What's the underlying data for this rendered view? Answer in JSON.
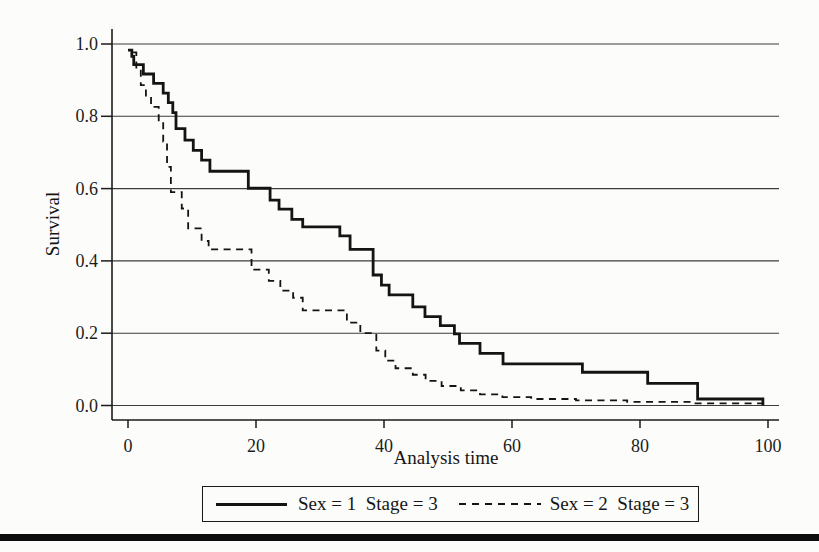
{
  "chart_data": {
    "type": "line",
    "subtype": "kaplan-meier-step",
    "title": "",
    "xlabel": "Analysis time",
    "ylabel": "Survival",
    "xlim": [
      0,
      100
    ],
    "ylim": [
      0.0,
      1.0
    ],
    "x_ticks": [
      0,
      20,
      40,
      60,
      80,
      100
    ],
    "x_tick_labels": [
      "0",
      "20",
      "40",
      "60",
      "80",
      "100"
    ],
    "y_ticks": [
      0.0,
      0.2,
      0.4,
      0.6,
      0.8,
      1.0
    ],
    "y_tick_labels": [
      "0.0",
      "0.2",
      "0.4",
      "0.6",
      "0.8",
      "1.0"
    ],
    "grid": "horizontal-only",
    "legend_position": "bottom-outside-boxed",
    "line_color": "#141414",
    "series": [
      {
        "name": "Sex = 1  Stage = 3",
        "style": "solid",
        "color": "#141414",
        "points": [
          [
            0.0,
            0.983
          ],
          [
            0.6,
            0.966
          ],
          [
            0.9,
            0.943
          ],
          [
            2.4,
            0.917
          ],
          [
            4.0,
            0.891
          ],
          [
            5.5,
            0.864
          ],
          [
            6.3,
            0.838
          ],
          [
            7.0,
            0.81
          ],
          [
            7.5,
            0.766
          ],
          [
            8.9,
            0.734
          ],
          [
            10.2,
            0.706
          ],
          [
            11.5,
            0.679
          ],
          [
            12.8,
            0.648
          ],
          [
            18.8,
            0.601
          ],
          [
            22.2,
            0.568
          ],
          [
            23.6,
            0.543
          ],
          [
            25.6,
            0.515
          ],
          [
            27.3,
            0.494
          ],
          [
            33.1,
            0.469
          ],
          [
            34.7,
            0.432
          ],
          [
            38.3,
            0.361
          ],
          [
            39.6,
            0.333
          ],
          [
            40.8,
            0.306
          ],
          [
            44.5,
            0.273
          ],
          [
            46.4,
            0.246
          ],
          [
            48.8,
            0.221
          ],
          [
            51.0,
            0.198
          ],
          [
            51.8,
            0.172
          ],
          [
            55.0,
            0.144
          ],
          [
            58.6,
            0.115
          ],
          [
            71.0,
            0.092
          ],
          [
            81.2,
            0.061
          ],
          [
            89.0,
            0.018
          ],
          [
            99.2,
            0.0
          ]
        ]
      },
      {
        "name": "Sex = 2  Stage = 3",
        "style": "dashed",
        "color": "#141414",
        "points": [
          [
            0.8,
            0.977
          ],
          [
            1.3,
            0.93
          ],
          [
            2.0,
            0.886
          ],
          [
            2.8,
            0.854
          ],
          [
            3.6,
            0.826
          ],
          [
            4.8,
            0.784
          ],
          [
            5.5,
            0.73
          ],
          [
            6.1,
            0.66
          ],
          [
            6.7,
            0.59
          ],
          [
            8.4,
            0.545
          ],
          [
            9.4,
            0.49
          ],
          [
            11.5,
            0.455
          ],
          [
            12.6,
            0.432
          ],
          [
            19.3,
            0.376
          ],
          [
            22.0,
            0.345
          ],
          [
            23.8,
            0.318
          ],
          [
            25.8,
            0.298
          ],
          [
            27.3,
            0.263
          ],
          [
            34.2,
            0.229
          ],
          [
            36.3,
            0.2
          ],
          [
            38.8,
            0.152
          ],
          [
            40.2,
            0.124
          ],
          [
            41.8,
            0.103
          ],
          [
            44.5,
            0.085
          ],
          [
            46.5,
            0.068
          ],
          [
            49.0,
            0.054
          ],
          [
            52.0,
            0.042
          ],
          [
            55.0,
            0.031
          ],
          [
            58.5,
            0.023
          ],
          [
            63.0,
            0.018
          ],
          [
            70.0,
            0.014
          ],
          [
            78.0,
            0.01
          ],
          [
            88.0,
            0.006
          ],
          [
            100.0,
            0.005
          ]
        ]
      }
    ]
  },
  "page": {
    "bottom_rule_color": "#0d0d0d",
    "background_color": "#fcfcfa"
  }
}
